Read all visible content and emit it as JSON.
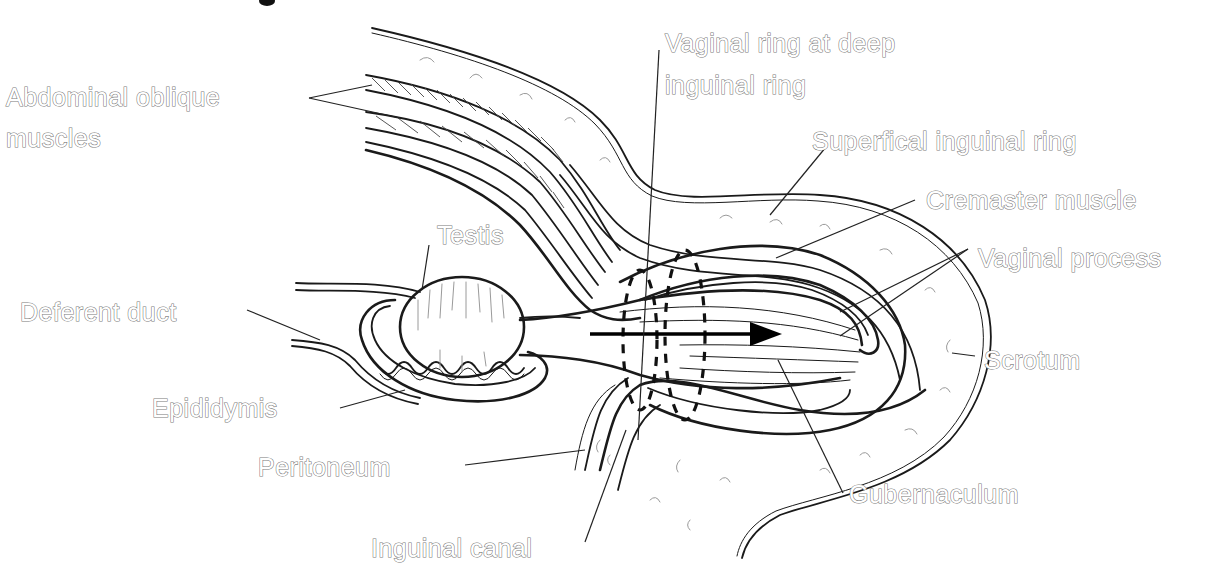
{
  "figure": {
    "label_color": "#7a7a7a",
    "line_color": "#1a1a1a",
    "background": "#ffffff"
  },
  "labels": {
    "abdominal_oblique_line1": "Abdominal oblique",
    "abdominal_oblique_line2": "muscles",
    "vaginal_ring_line1": "Vaginal ring at deep",
    "vaginal_ring_line2": "inguinal ring",
    "superficial_ring": "Superfical inguinal ring",
    "cremaster": "Cremaster muscle",
    "testis": "Testis",
    "vaginal_process": "Vaginal process",
    "deferent_duct": "Deferent duct",
    "scrotum": "Scrotum",
    "epididymis": "Epididymis",
    "peritoneum": "Peritoneum",
    "gubernaculum": "Gubernaculum",
    "inguinal_canal": "Inguinal canal"
  },
  "annotations": {
    "arrow": "direction-of-descent-arrow",
    "rings": "dashed-ring-outlines"
  }
}
